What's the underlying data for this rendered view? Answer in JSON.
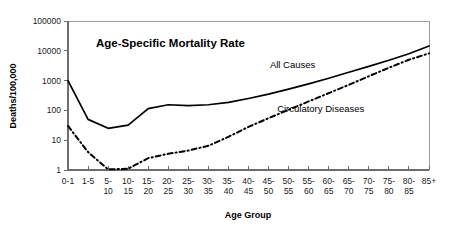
{
  "chart_data": {
    "type": "line",
    "title": "Age-Specific Mortality Rate",
    "xlabel": "Age Group",
    "ylabel": "Deaths/100,000",
    "yscale": "log",
    "ylim": [
      1,
      100000
    ],
    "ytick_labels": [
      "1",
      "10",
      "100",
      "1000",
      "10000",
      "100000"
    ],
    "ytick_values": [
      1,
      10,
      100,
      1000,
      10000,
      100000
    ],
    "grid": false,
    "legend_position": "inline-annotation",
    "categories": [
      "0-1",
      "1-5",
      "5-10",
      "10-15",
      "15-20",
      "20-25",
      "25-30",
      "30-35",
      "35-40",
      "40-45",
      "45-50",
      "50-55",
      "55-60",
      "60-65",
      "65-70",
      "70-75",
      "75-80",
      "80-85",
      "85+"
    ],
    "category_lines": [
      [
        "0-1",
        ""
      ],
      [
        "1-5",
        ""
      ],
      [
        "5-",
        "10"
      ],
      [
        "10-",
        "15"
      ],
      [
        "15-",
        "20"
      ],
      [
        "20-",
        "25"
      ],
      [
        "25-",
        "30"
      ],
      [
        "30-",
        "35"
      ],
      [
        "35-",
        "40"
      ],
      [
        "40-",
        "45"
      ],
      [
        "45-",
        "50"
      ],
      [
        "50-",
        "55"
      ],
      [
        "55-",
        "60"
      ],
      [
        "60-",
        "65"
      ],
      [
        "65-",
        "70"
      ],
      [
        "70-",
        "75"
      ],
      [
        "75-",
        "80"
      ],
      [
        "80-",
        "85"
      ],
      [
        "85+",
        ""
      ]
    ],
    "series": [
      {
        "name": "All Causes",
        "style": "solid",
        "color": "#000000",
        "values": [
          1000,
          50,
          25,
          32,
          115,
          155,
          145,
          155,
          185,
          250,
          350,
          520,
          780,
          1200,
          1900,
          3000,
          4800,
          8000,
          14500
        ]
      },
      {
        "name": "Circulatory Diseases",
        "style": "dash-dot",
        "color": "#000000",
        "values": [
          30,
          4,
          1.05,
          1.1,
          2.5,
          3.5,
          4.5,
          6.5,
          13,
          28,
          55,
          105,
          200,
          380,
          720,
          1400,
          2700,
          5000,
          8200
        ]
      }
    ],
    "annotations": [
      {
        "text": "All Causes",
        "x_index": 11.2,
        "y_value": 2600
      },
      {
        "text": "Circulatory Diseases",
        "x_index": 12.6,
        "y_value": 90
      }
    ]
  }
}
